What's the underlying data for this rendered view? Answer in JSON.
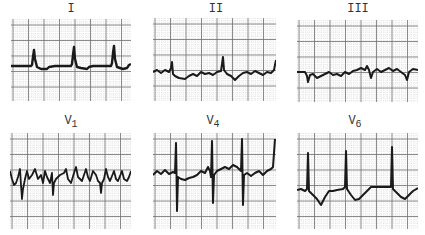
{
  "figure": {
    "type": "ecg_12_lead_excerpt",
    "grid": {
      "minor_color": "#c8c8c8",
      "major_color": "#6e6e6e",
      "trace_color": "#1a1a1a",
      "background": "#ffffff"
    },
    "leads": [
      {
        "id": "I",
        "label": "I",
        "sub": "",
        "x": 11,
        "y": 19,
        "w": 120,
        "h": 82,
        "label_x": 51,
        "label_y": 2
      },
      {
        "id": "II",
        "label": "II",
        "sub": "",
        "x": 153,
        "y": 18,
        "w": 123,
        "h": 83,
        "label_x": 196,
        "label_y": 2
      },
      {
        "id": "III",
        "label": "III",
        "sub": "",
        "x": 297,
        "y": 20,
        "w": 121,
        "h": 82,
        "label_x": 338,
        "label_y": 2
      },
      {
        "id": "V1",
        "label": "V",
        "sub": "1",
        "x": 10,
        "y": 133,
        "w": 121,
        "h": 96,
        "label_x": 54,
        "label_y": 114
      },
      {
        "id": "V4",
        "label": "V",
        "sub": "4",
        "x": 153,
        "y": 133,
        "w": 123,
        "h": 96,
        "label_x": 196,
        "label_y": 114
      },
      {
        "id": "V6",
        "label": "V",
        "sub": "6",
        "x": 297,
        "y": 133,
        "w": 121,
        "h": 96,
        "label_x": 337,
        "label_y": 114
      }
    ]
  }
}
